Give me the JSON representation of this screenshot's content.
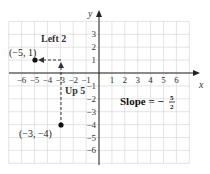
{
  "chart_data": {
    "type": "scatter",
    "title": "",
    "xlabel": "x",
    "ylabel": "y",
    "xlim": [
      -7,
      7
    ],
    "ylim": [
      -7,
      4
    ],
    "grid": true,
    "x_ticks": [
      -6,
      -5,
      -4,
      -3,
      -2,
      -1,
      1,
      2,
      3,
      4,
      5,
      6
    ],
    "y_ticks": [
      3,
      2,
      1,
      -1,
      -2,
      -3,
      -4,
      -5,
      -6
    ],
    "points": [
      {
        "x": -5,
        "y": 1,
        "label": "(−5, 1)"
      },
      {
        "x": -3,
        "y": -4,
        "label": "(−3, −4)"
      }
    ],
    "annotations": [
      {
        "text": "Left 2",
        "type": "horizontal-dashed-arrow",
        "from": [
          -3,
          1
        ],
        "to": [
          -5,
          1
        ]
      },
      {
        "text": "Up 5",
        "type": "vertical-dashed-arrow",
        "from": [
          -3,
          -4
        ],
        "to": [
          -3,
          1
        ]
      }
    ],
    "slope_text": {
      "prefix": "Slope = −",
      "numerator": "5",
      "denominator": "2",
      "value": -2.5
    }
  },
  "labels": {
    "x_axis": "x",
    "y_axis": "y",
    "left_run": "Left 2",
    "up_rise": "Up 5",
    "point_a": "(−5, 1)",
    "point_b": "(−3, −4)",
    "slope_prefix": "Slope = −",
    "slope_num": "5",
    "slope_den": "2"
  },
  "colors": {
    "grid": "#d9d9d9",
    "axis": "#222222",
    "point": "#111111"
  }
}
